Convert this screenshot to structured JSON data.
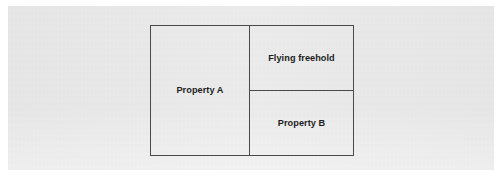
{
  "figure": {
    "type": "property-plan-diagram",
    "background_color": "#ffffff",
    "panel_color": "#e9e9e9",
    "line_color": "#4a4a4a",
    "text_color": "#1e1e1e"
  },
  "diagram": {
    "cells": [
      {
        "id": "property-a",
        "label": "Property A",
        "position": "left",
        "spans_full_height": true
      },
      {
        "id": "flying-freehold",
        "label": "Flying freehold",
        "position": "top-right",
        "spans_full_height": false
      },
      {
        "id": "property-b",
        "label": "Property B",
        "position": "bottom-right",
        "spans_full_height": false
      }
    ]
  }
}
